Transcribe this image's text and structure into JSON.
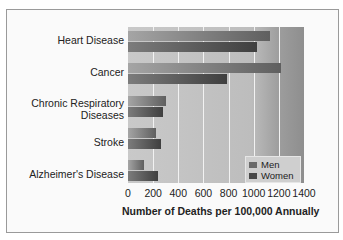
{
  "chart_data": {
    "type": "bar",
    "orientation": "horizontal",
    "title": "",
    "categories": [
      "Heart Disease",
      "Cancer",
      "Chronic Respiratory Diseases",
      "Stroke",
      "Alzheimer's Disease"
    ],
    "series": [
      {
        "name": "Men",
        "values": [
          1130,
          1220,
          300,
          220,
          130
        ],
        "color": "#707070"
      },
      {
        "name": "Women",
        "values": [
          1030,
          790,
          280,
          265,
          235
        ],
        "color": "#505050"
      }
    ],
    "xlabel": "Number of Deaths per 100,000 Annually",
    "ylabel": "",
    "xlim": [
      0,
      1400
    ],
    "xticks": [
      "0",
      "200",
      "400",
      "600",
      "800",
      "1000",
      "1200",
      "1400"
    ],
    "grid": true,
    "legend_position": "lower right"
  },
  "labels": {
    "cat0": "Heart Disease",
    "cat1": "Cancer",
    "cat2a": "Chronic Respiratory",
    "cat2b": "Diseases",
    "cat3": "Stroke",
    "cat4": "Alzheimer's Disease",
    "legend_men": "Men",
    "legend_women": "Women"
  }
}
